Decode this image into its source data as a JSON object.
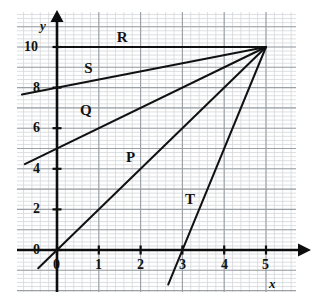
{
  "chart_data": {
    "type": "line",
    "title": "",
    "subtitle": "",
    "xlabel": "x",
    "ylabel": "y",
    "xlim": [
      -0.95,
      5.75
    ],
    "ylim": [
      -1.85,
      11.7
    ],
    "grid": true,
    "grid_major_step_x": 1,
    "grid_major_step_y": 1,
    "grid_minor_per_major": 5,
    "legend_position": "inline-labels",
    "xticks": [
      0,
      1,
      2,
      3,
      4,
      5
    ],
    "xtick_labels": [
      "0",
      "1",
      "2",
      "3",
      "4",
      "5"
    ],
    "yticks": [
      0,
      2,
      4,
      6,
      8,
      10
    ],
    "ytick_labels": [
      "0",
      "2",
      "4",
      "6",
      "8",
      "10"
    ],
    "common_point": [
      5,
      10
    ],
    "annotations": [
      {
        "text": "R",
        "x": 1.55,
        "y": 10.45
      },
      {
        "text": "S",
        "x": 0.77,
        "y": 8.9
      },
      {
        "text": "Q",
        "x": 0.67,
        "y": 6.85
      },
      {
        "text": "P",
        "x": 1.77,
        "y": 4.55
      },
      {
        "text": "T",
        "x": 3.18,
        "y": 2.45
      }
    ],
    "series": [
      {
        "name": "R",
        "label": "R",
        "slope": 0,
        "intercept": 10,
        "color": "#111111",
        "points": [
          [
            0,
            10
          ],
          [
            5,
            10
          ]
        ]
      },
      {
        "name": "S",
        "label": "S",
        "slope": 0.4,
        "intercept": 8,
        "color": "#111111",
        "points": [
          [
            -0.84,
            7.66
          ],
          [
            5,
            10
          ]
        ]
      },
      {
        "name": "Q",
        "label": "Q",
        "slope": 1,
        "intercept": 5,
        "color": "#111111",
        "points": [
          [
            -0.77,
            4.23
          ],
          [
            5,
            10
          ]
        ]
      },
      {
        "name": "P",
        "label": "P",
        "slope": 2,
        "intercept": 0,
        "color": "#111111",
        "points": [
          [
            -0.45,
            -0.9
          ],
          [
            5,
            10
          ]
        ]
      },
      {
        "name": "T",
        "label": "T",
        "slope": 5,
        "intercept": -15,
        "color": "#111111",
        "points": [
          [
            2.66,
            -1.7
          ],
          [
            5,
            10
          ]
        ]
      }
    ]
  },
  "axes": {
    "y_axis_name": "y",
    "x_axis_name": "x",
    "tick_labels_y": [
      "10",
      "8",
      "6",
      "4",
      "2",
      "0"
    ],
    "tick_labels_x": [
      "0",
      "1",
      "2",
      "3",
      "4",
      "5"
    ]
  },
  "colors": {
    "line": "#111111",
    "axis": "#0d0d0d",
    "grid_major": "#9aa0a6",
    "grid_minor": "#d4d7db",
    "background": "#ffffff",
    "text": "#111111"
  }
}
